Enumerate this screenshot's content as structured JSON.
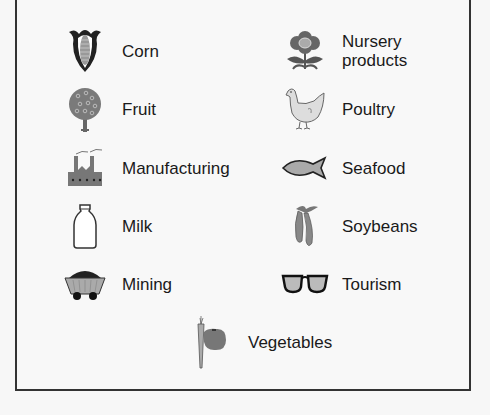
{
  "legend": {
    "items": [
      {
        "label": "Corn",
        "icon": "corn-icon"
      },
      {
        "label": "Fruit",
        "icon": "fruit-tree-icon"
      },
      {
        "label": "Manufacturing",
        "icon": "factory-icon"
      },
      {
        "label": "Milk",
        "icon": "milk-bottle-icon"
      },
      {
        "label": "Mining",
        "icon": "mine-cart-icon"
      },
      {
        "label": "Nursery products",
        "label_line1": "Nursery",
        "label_line2": "products",
        "icon": "flower-icon"
      },
      {
        "label": "Poultry",
        "icon": "chicken-icon"
      },
      {
        "label": "Seafood",
        "icon": "fish-icon"
      },
      {
        "label": "Soybeans",
        "icon": "soybean-pod-icon"
      },
      {
        "label": "Tourism",
        "icon": "sunglasses-icon"
      },
      {
        "label": "Vegetables",
        "icon": "vegetables-icon"
      }
    ]
  },
  "colors": {
    "border": "#333333",
    "icon_fill": "#8a8a8a",
    "icon_dark": "#222222",
    "background": "#f8f8f8"
  }
}
